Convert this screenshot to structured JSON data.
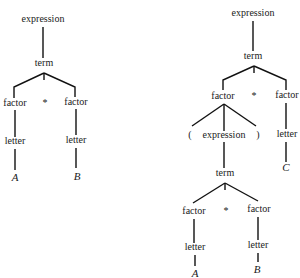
{
  "diagram": {
    "type": "parse-trees",
    "trees": [
      {
        "id": "left",
        "nodes": [
          {
            "id": "L_expr",
            "label": "expression",
            "x": 43,
            "y": 22
          },
          {
            "id": "L_term",
            "label": "term",
            "x": 44,
            "y": 66
          },
          {
            "id": "L_f1",
            "label": "factor",
            "x": 15,
            "y": 106
          },
          {
            "id": "L_star",
            "label": "*",
            "x": 45,
            "y": 106
          },
          {
            "id": "L_f2",
            "label": "factor",
            "x": 76,
            "y": 105
          },
          {
            "id": "L_let1",
            "label": "letter",
            "x": 15,
            "y": 144
          },
          {
            "id": "L_let2",
            "label": "letter",
            "x": 76,
            "y": 143
          },
          {
            "id": "L_A",
            "label": "A",
            "x": 15,
            "y": 181,
            "italic": true
          },
          {
            "id": "L_B",
            "label": "B",
            "x": 77,
            "y": 180,
            "italic": true
          }
        ],
        "edges": [
          {
            "points": [
              [
                43,
                27
              ],
              [
                43,
                58
              ]
            ]
          },
          {
            "points": [
              [
                44,
                73
              ],
              [
                14,
                87
              ],
              [
                14,
                98
              ]
            ]
          },
          {
            "points": [
              [
                44,
                73
              ],
              [
                75,
                87
              ],
              [
                75,
                97
              ]
            ]
          },
          {
            "points": [
              [
                44,
                73
              ],
              [
                44,
                80
              ]
            ]
          },
          {
            "points": [
              [
                15,
                110
              ],
              [
                15,
                137
              ]
            ]
          },
          {
            "points": [
              [
                76,
                109
              ],
              [
                76,
                135
              ]
            ]
          },
          {
            "points": [
              [
                15,
                149
              ],
              [
                15,
                170
              ]
            ]
          },
          {
            "points": [
              [
                76,
                148
              ],
              [
                76,
                168
              ]
            ]
          }
        ]
      },
      {
        "id": "right",
        "nodes": [
          {
            "id": "R_expr",
            "label": "expression",
            "x": 253,
            "y": 16
          },
          {
            "id": "R_term",
            "label": "term",
            "x": 253,
            "y": 59
          },
          {
            "id": "R_f1",
            "label": "factor",
            "x": 223,
            "y": 99
          },
          {
            "id": "R_star",
            "label": "*",
            "x": 254,
            "y": 99
          },
          {
            "id": "R_f2",
            "label": "factor",
            "x": 287,
            "y": 98
          },
          {
            "id": "R_lp",
            "label": "(",
            "x": 190,
            "y": 138
          },
          {
            "id": "R_expr2",
            "label": "expression",
            "x": 224,
            "y": 138
          },
          {
            "id": "R_rp",
            "label": ")",
            "x": 258,
            "y": 138
          },
          {
            "id": "R_let3",
            "label": "letter",
            "x": 287,
            "y": 137
          },
          {
            "id": "R_term2",
            "label": "term",
            "x": 225,
            "y": 176
          },
          {
            "id": "R_C",
            "label": "C",
            "x": 286,
            "y": 171,
            "italic": true
          },
          {
            "id": "R_f3",
            "label": "factor",
            "x": 194,
            "y": 214
          },
          {
            "id": "R_star2",
            "label": "*",
            "x": 226,
            "y": 214
          },
          {
            "id": "R_f4",
            "label": "factor",
            "x": 259,
            "y": 212
          },
          {
            "id": "R_let4",
            "label": "letter",
            "x": 195,
            "y": 250
          },
          {
            "id": "R_let5",
            "label": "letter",
            "x": 258,
            "y": 248
          },
          {
            "id": "R_A",
            "label": "A",
            "x": 195,
            "y": 277,
            "italic": true
          },
          {
            "id": "R_B",
            "label": "B",
            "x": 257,
            "y": 273,
            "italic": true
          }
        ],
        "edges": [
          {
            "points": [
              [
                253,
                21
              ],
              [
                253,
                51
              ]
            ]
          },
          {
            "points": [
              [
                254,
                66
              ],
              [
                223,
                80
              ],
              [
                223,
                90
              ]
            ]
          },
          {
            "points": [
              [
                254,
                66
              ],
              [
                286,
                80
              ],
              [
                286,
                90
              ]
            ]
          },
          {
            "points": [
              [
                254,
                66
              ],
              [
                254,
                73
              ]
            ]
          },
          {
            "points": [
              [
                224,
                104
              ],
              [
                192,
                126
              ]
            ]
          },
          {
            "points": [
              [
                224,
                104
              ],
              [
                224,
                131
              ]
            ]
          },
          {
            "points": [
              [
                224,
                104
              ],
              [
                256,
                126
              ]
            ]
          },
          {
            "points": [
              [
                286,
                103
              ],
              [
                286,
                129
              ]
            ]
          },
          {
            "points": [
              [
                224,
                142
              ],
              [
                224,
                168
              ]
            ]
          },
          {
            "points": [
              [
                286,
                142
              ],
              [
                286,
                162
              ]
            ]
          },
          {
            "points": [
              [
                225,
                183
              ],
              [
                193,
                203
              ]
            ]
          },
          {
            "points": [
              [
                225,
                183
              ],
              [
                258,
                201
              ]
            ]
          },
          {
            "points": [
              [
                225,
                183
              ],
              [
                225,
                190
              ]
            ]
          },
          {
            "points": [
              [
                194,
                219
              ],
              [
                194,
                243
              ]
            ]
          },
          {
            "points": [
              [
                258,
                217
              ],
              [
                258,
                240
              ]
            ]
          },
          {
            "points": [
              [
                195,
                255
              ],
              [
                195,
                266
              ]
            ]
          },
          {
            "points": [
              [
                258,
                253
              ],
              [
                258,
                262
              ]
            ]
          }
        ]
      }
    ]
  }
}
